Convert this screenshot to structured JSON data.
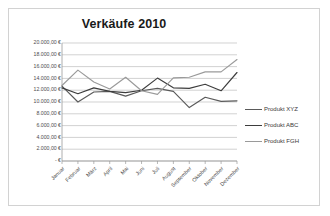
{
  "chart_data": {
    "type": "line",
    "title": "Verkäufe 2010",
    "xlabel": "",
    "ylabel": "",
    "grid": true,
    "legend_position": "right",
    "ylim": [
      0,
      20000
    ],
    "ytick_step": 2000,
    "categories": [
      "Januar",
      "Februar",
      "März",
      "April",
      "Mai",
      "Juni",
      "Juli",
      "August",
      "September",
      "Oktober",
      "November",
      "Dezember"
    ],
    "ytick_labels": [
      "20.000,00 €",
      "18.000,00 €",
      "16.000,00 €",
      "14.000,00 €",
      "12.000,00 €",
      "10.000,00 €",
      "8.000,00 €",
      "6.000,00 €",
      "4.000,00 €",
      "2.000,00 €",
      "-   €"
    ],
    "ytick_values": [
      20000,
      18000,
      16000,
      14000,
      12000,
      10000,
      8000,
      6000,
      4000,
      2000,
      0
    ],
    "series": [
      {
        "name": "Produkt XYZ",
        "color": "#5a5a5a",
        "values": [
          12700,
          10000,
          11700,
          11800,
          11000,
          11900,
          12300,
          11800,
          9050,
          10800,
          10100,
          10200
        ]
      },
      {
        "name": "Produkt ABC",
        "color": "#3d3d3d",
        "values": [
          12400,
          11400,
          12400,
          11800,
          11600,
          12000,
          14050,
          12400,
          12300,
          13000,
          11900,
          15000
        ]
      },
      {
        "name": "Produkt FGH",
        "color": "#9a9a9a",
        "values": [
          12800,
          15400,
          13400,
          12200,
          14200,
          11900,
          11300,
          14100,
          14200,
          15100,
          15100,
          17200
        ]
      }
    ]
  },
  "legend": {
    "items": [
      {
        "label": "Produkt XYZ",
        "color": "#5a5a5a"
      },
      {
        "label": "Produkt ABC",
        "color": "#3d3d3d"
      },
      {
        "label": "Produkt FGH",
        "color": "#9a9a9a"
      }
    ]
  },
  "colors": {
    "frame_border": "#d2d2d2",
    "gridline": "#bfbfbf",
    "axis": "#9a9a9a",
    "title_text": "#1a1a1a",
    "tick_text": "#4d4d4d",
    "background": "#ffffff"
  }
}
